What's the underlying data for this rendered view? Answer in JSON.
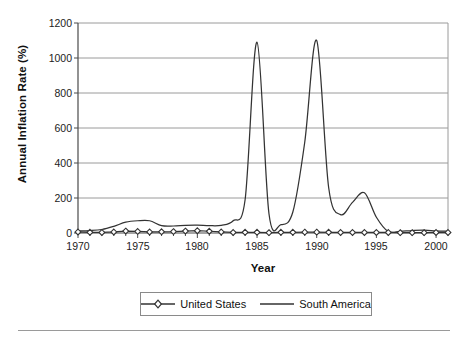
{
  "chart_data": {
    "type": "line",
    "title": "",
    "xlabel": "Year",
    "ylabel": "Annual Inflation Rate (%)",
    "xlim": [
      1970,
      2001
    ],
    "ylim": [
      0,
      1200
    ],
    "yticks": [
      0,
      200,
      400,
      600,
      800,
      1000,
      1200
    ],
    "xticks": [
      1970,
      1975,
      1980,
      1985,
      1990,
      1995,
      2000
    ],
    "xtick_labels": [
      "1970",
      "1975",
      "1980",
      "1985",
      "1990",
      "1995",
      "2000"
    ],
    "ytick_labels": [
      "0",
      "200",
      "400",
      "600",
      "800",
      "1000",
      "1200"
    ],
    "grid": "horizontal",
    "legend_position": "bottom",
    "x": [
      1970,
      1971,
      1972,
      1973,
      1974,
      1975,
      1976,
      1977,
      1978,
      1979,
      1980,
      1981,
      1982,
      1983,
      1984,
      1985,
      1986,
      1987,
      1988,
      1989,
      1990,
      1991,
      1992,
      1993,
      1994,
      1995,
      1996,
      1997,
      1998,
      1999,
      2000,
      2001
    ],
    "series": [
      {
        "name": "United States",
        "marker": "diamond",
        "color": "#333333",
        "values": [
          6,
          4,
          3,
          6,
          11,
          9,
          6,
          7,
          8,
          11,
          13,
          10,
          6,
          3,
          4,
          4,
          2,
          4,
          4,
          5,
          5,
          4,
          3,
          3,
          3,
          3,
          3,
          2,
          2,
          2,
          3,
          3
        ]
      },
      {
        "name": "South America",
        "marker": "none",
        "color": "#333333",
        "values": [
          12,
          14,
          20,
          38,
          62,
          70,
          70,
          42,
          40,
          44,
          45,
          42,
          44,
          70,
          190,
          1090,
          110,
          48,
          120,
          520,
          1100,
          260,
          105,
          175,
          230,
          90,
          8,
          10,
          14,
          16,
          12,
          10
        ]
      }
    ],
    "annotations": []
  },
  "legend": {
    "entries": [
      {
        "label": "United States",
        "marker": "diamond"
      },
      {
        "label": "South America",
        "marker": "line"
      }
    ]
  }
}
